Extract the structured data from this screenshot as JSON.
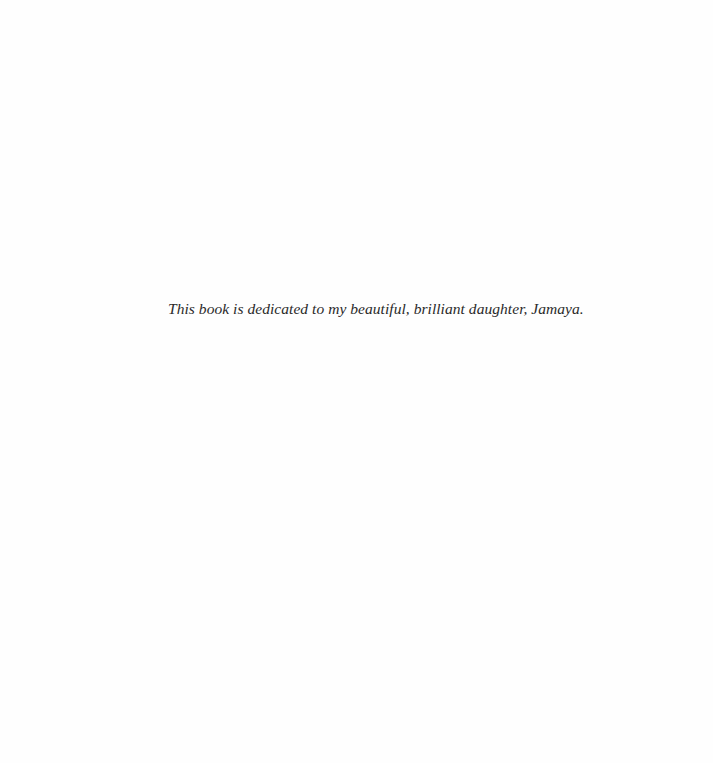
{
  "page": {
    "dedication": "This book is dedicated to my beautiful, brilliant daughter, Jamaya."
  }
}
